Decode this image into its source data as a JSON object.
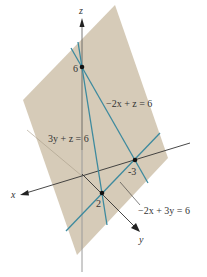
{
  "figure": {
    "plane_color": "#d6cbb8",
    "line_color": "#3d8a9e",
    "axis_color": "#222222",
    "axes": {
      "x_label": "x",
      "y_label": "y",
      "z_label": "z"
    },
    "points": [
      {
        "label": "6",
        "desc": "z-intercept"
      },
      {
        "label": "2",
        "desc": "y-intercept"
      },
      {
        "label": "-3",
        "desc": "x-intercept"
      }
    ],
    "traces": [
      {
        "label": "3y + z = 6"
      },
      {
        "label": "−2x + z = 6"
      },
      {
        "label": "−2x + 3y = 6"
      }
    ]
  }
}
